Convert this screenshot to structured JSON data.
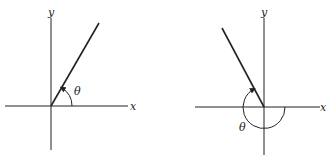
{
  "figures": [
    {
      "id": "left",
      "description": "Angle theta in first quadrant measured counterclockwise from positive x-axis",
      "x_label": "x",
      "y_label": "y",
      "angle_label": "θ",
      "angle_direction": "counterclockwise",
      "angle_degrees_approx": 60
    },
    {
      "id": "right",
      "description": "Angle theta measured the long way (reflex) from positive x-axis to a ray in the second quadrant",
      "x_label": "x",
      "y_label": "y",
      "angle_label": "θ",
      "angle_direction": "clockwise",
      "angle_degrees_approx": -240
    }
  ],
  "colors": {
    "stroke": "#222222",
    "background": "#ffffff"
  }
}
